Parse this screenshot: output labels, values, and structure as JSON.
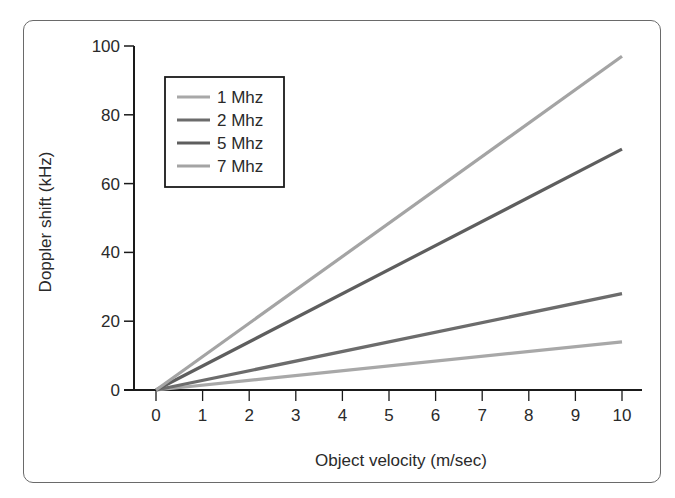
{
  "chart_data": {
    "type": "line",
    "title": "",
    "xlabel": "Object velocity (m/sec)",
    "ylabel": "Doppler shift (kHz)",
    "xlim": [
      0,
      10
    ],
    "ylim": [
      0,
      100
    ],
    "x_ticks": [
      "0",
      "1",
      "2",
      "3",
      "4",
      "5",
      "6",
      "7",
      "8",
      "9",
      "10"
    ],
    "y_ticks": [
      "0",
      "20",
      "40",
      "60",
      "80",
      "100"
    ],
    "grid": false,
    "legend_position": "upper-left",
    "x": [
      0,
      10
    ],
    "series": [
      {
        "name": "1 Mhz",
        "color": "#a8a8a8",
        "values": [
          0,
          14
        ]
      },
      {
        "name": "2 Mhz",
        "color": "#6c6c6c",
        "values": [
          0,
          28
        ]
      },
      {
        "name": "5 Mhz",
        "color": "#5e5e5e",
        "values": [
          0,
          70
        ]
      },
      {
        "name": "7 Mhz",
        "color": "#a4a4a4",
        "values": [
          0,
          97
        ]
      }
    ]
  },
  "legend": {
    "items": [
      {
        "label": "1 Mhz",
        "color": "#a8a8a8"
      },
      {
        "label": "2 Mhz",
        "color": "#6c6c6c"
      },
      {
        "label": "5 Mhz",
        "color": "#5e5e5e"
      },
      {
        "label": "7 Mhz",
        "color": "#a4a4a4"
      }
    ]
  },
  "axes": {
    "x_label": "Object velocity (m/sec)",
    "y_label": "Doppler shift (kHz)"
  }
}
